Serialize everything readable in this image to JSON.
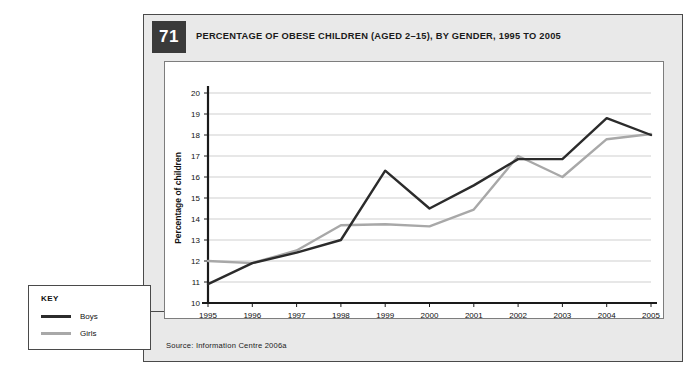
{
  "figure": {
    "number": "71",
    "title": "PERCENTAGE OF OBESE CHILDREN (AGED 2–15), BY GENDER, 1995 TO 2005",
    "source": "Source: Information Centre 2006a"
  },
  "key": {
    "heading": "KEY",
    "items": [
      {
        "label": "Boys",
        "color": "#2b2b2b"
      },
      {
        "label": "Girls",
        "color": "#a8a8a8"
      }
    ]
  },
  "colors": {
    "boys": "#2b2b2b",
    "girls": "#a8a8a8",
    "grid": "#c9c9c9",
    "axis": "#1a1a1a",
    "panel": "#e9e9e9",
    "badge": "#3a3a3a",
    "card": "#ffffff"
  },
  "chart_data": {
    "type": "line",
    "title": "PERCENTAGE OF OBESE CHILDREN (AGED 2–15), BY GENDER, 1995 TO 2005",
    "xlabel": "Year",
    "ylabel": "Percentage of children",
    "categories": [
      "1995",
      "1996",
      "1997",
      "1998",
      "1999",
      "2000",
      "2001",
      "2002",
      "2003",
      "2004",
      "2005"
    ],
    "x": [
      1995,
      1996,
      1997,
      1998,
      1999,
      2000,
      2001,
      2002,
      2003,
      2004,
      2005
    ],
    "ylim": [
      10,
      20
    ],
    "yticks": [
      10,
      11,
      12,
      13,
      14,
      15,
      16,
      17,
      18,
      19,
      20
    ],
    "ytick_labels": [
      "10",
      "11",
      "12",
      "13",
      "14",
      "15",
      "16",
      "17",
      "18",
      "19",
      "20"
    ],
    "xlim": [
      1995,
      2005
    ],
    "grid": "horizontal",
    "legend": "external-key-box-bottom-left",
    "series": [
      {
        "name": "Boys",
        "color": "#2b2b2b",
        "values": [
          10.9,
          11.9,
          12.4,
          13.0,
          16.3,
          14.5,
          15.6,
          16.85,
          16.85,
          18.8,
          18.0
        ]
      },
      {
        "name": "Girls",
        "color": "#a8a8a8",
        "values": [
          12.0,
          11.9,
          12.5,
          13.7,
          13.75,
          13.65,
          14.45,
          17.0,
          16.0,
          17.8,
          18.05
        ]
      }
    ]
  }
}
